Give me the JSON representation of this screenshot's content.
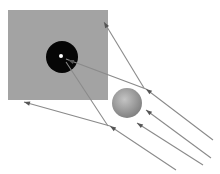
{
  "diagram": {
    "colors": {
      "background": "#ffffff",
      "screen": "#a3a3a3",
      "aperture": "#060606",
      "pinpoint": "#ffffff",
      "sphere_light": "#c4c4c4",
      "sphere_dark": "#7e7e7e",
      "ray": "#8a8a8a",
      "arrow": "#555555"
    },
    "screen": {
      "x": 8,
      "y": 10,
      "width": 100,
      "height": 90
    },
    "aperture": {
      "cx": 62,
      "cy": 57,
      "r": 16
    },
    "pinpoint": {
      "cx": 61,
      "cy": 56,
      "r": 2
    },
    "sphere": {
      "cx": 127,
      "cy": 103,
      "r": 15
    },
    "rays": [
      {
        "id": "ray-1",
        "points": [
          [
            213,
            140
          ],
          [
            146,
            89
          ],
          [
            66,
            59
          ]
        ]
      },
      {
        "id": "ray-2",
        "points": [
          [
            211,
            158
          ],
          [
            146,
            110
          ]
        ]
      },
      {
        "id": "ray-3",
        "points": [
          [
            203,
            165
          ],
          [
            137,
            123
          ]
        ]
      },
      {
        "id": "ray-4",
        "points": [
          [
            176,
            170
          ],
          [
            110,
            126
          ],
          [
            24,
            102
          ]
        ]
      },
      {
        "id": "ray-5",
        "points": [
          [
            144,
            88
          ],
          [
            104,
            22
          ]
        ]
      },
      {
        "id": "ray-6",
        "points": [
          [
            108,
            126
          ],
          [
            66,
            62
          ]
        ]
      }
    ],
    "arrowheads": [
      {
        "id": "arrow-1",
        "x": 146,
        "y": 89,
        "angle": 217
      },
      {
        "id": "arrow-2",
        "x": 146,
        "y": 110,
        "angle": 217
      },
      {
        "id": "arrow-3",
        "x": 137,
        "y": 123,
        "angle": 213
      },
      {
        "id": "arrow-4",
        "x": 110,
        "y": 126,
        "angle": 214
      },
      {
        "id": "arrow-5",
        "x": 24,
        "y": 102,
        "angle": 196
      },
      {
        "id": "arrow-6",
        "x": 104,
        "y": 22,
        "angle": 239
      },
      {
        "id": "arrow-7",
        "x": 68,
        "y": 60,
        "angle": 200
      }
    ]
  }
}
